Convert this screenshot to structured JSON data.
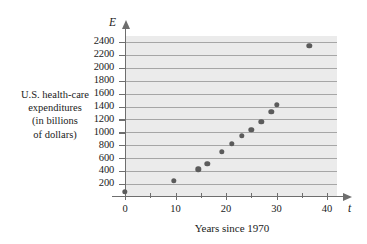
{
  "chart_data": {
    "type": "scatter",
    "title": "",
    "xlabel": "Years since 1970",
    "ylabel": "U.S. health-care expenditures (in billions of dollars)",
    "x_var": "t",
    "y_var": "E",
    "xlim": [
      -2.5,
      43
    ],
    "ylim": [
      0,
      2500
    ],
    "grid": true,
    "legend": null,
    "xticks": [
      0,
      10,
      20,
      30,
      40
    ],
    "xtick_labels": [
      "0",
      "10",
      "20",
      "30",
      "40"
    ],
    "xminor_ticks": [
      5,
      15,
      25,
      35
    ],
    "yticks": [
      200,
      400,
      600,
      800,
      1000,
      1200,
      1400,
      1600,
      1800,
      2000,
      2200,
      2400
    ],
    "ytick_labels": [
      "200",
      "400",
      "600",
      "800",
      "1000",
      "1200",
      "1400",
      "1600",
      "1800",
      "2000",
      "2200",
      "2400"
    ],
    "points": [
      {
        "x": 0,
        "y": 75
      },
      {
        "x": 9.7,
        "y": 250
      },
      {
        "x": 14.5,
        "y": 430
      },
      {
        "x": 16.3,
        "y": 510
      },
      {
        "x": 19.2,
        "y": 695
      },
      {
        "x": 21.2,
        "y": 825
      },
      {
        "x": 23.1,
        "y": 945
      },
      {
        "x": 25.0,
        "y": 1040
      },
      {
        "x": 27.0,
        "y": 1165
      },
      {
        "x": 29.0,
        "y": 1320
      },
      {
        "x": 30.1,
        "y": 1425
      },
      {
        "x": 36.5,
        "y": 2340
      }
    ]
  },
  "labels": {
    "y_title_lines": [
      "U.S. health-care",
      "expenditures",
      "(in billions",
      "of dollars)"
    ],
    "x_title": "Years since 1970",
    "y_var": "E",
    "x_var": "t"
  },
  "colors": {
    "plot_background": "#ebebeb",
    "gridline": "#9a9a9a",
    "axis": "#6e6e6e",
    "marker": "#5b5b5b",
    "text": "#1a1a1a",
    "page_background": "#ffffff"
  }
}
